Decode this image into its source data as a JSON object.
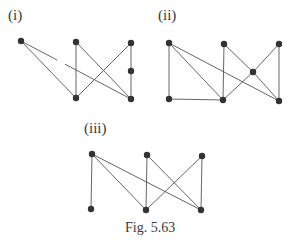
{
  "figure": {
    "caption": "Fig. 5.63",
    "colors": {
      "edge": "#555555",
      "vertex": "#333333",
      "text": "#3a3a3a"
    },
    "graphs": [
      {
        "id": "i",
        "label": "(i)",
        "label_pos": [
          8,
          8
        ],
        "vertices": [
          {
            "id": "a",
            "x": 21,
            "y": 41
          },
          {
            "id": "b",
            "x": 76,
            "y": 42
          },
          {
            "id": "c",
            "x": 131,
            "y": 43
          },
          {
            "id": "d",
            "x": 131,
            "y": 71
          },
          {
            "id": "e",
            "x": 76,
            "y": 98
          },
          {
            "id": "f",
            "x": 131,
            "y": 99
          }
        ],
        "edges": [
          {
            "from": "a",
            "to": "e"
          },
          {
            "from": "a",
            "to": "f",
            "broken": true,
            "gap": [
              0.33,
              0.4
            ]
          },
          {
            "from": "b",
            "to": "e"
          },
          {
            "from": "b",
            "to": "f"
          },
          {
            "from": "c",
            "to": "e"
          },
          {
            "from": "c",
            "to": "d"
          },
          {
            "from": "d",
            "to": "f"
          }
        ]
      },
      {
        "id": "ii",
        "label": "(ii)",
        "label_pos": [
          158,
          8
        ],
        "vertices": [
          {
            "id": "a",
            "x": 169,
            "y": 43
          },
          {
            "id": "b",
            "x": 224,
            "y": 44
          },
          {
            "id": "c",
            "x": 279,
            "y": 44
          },
          {
            "id": "m",
            "x": 253,
            "y": 72
          },
          {
            "id": "d",
            "x": 169,
            "y": 99
          },
          {
            "id": "e",
            "x": 223,
            "y": 100
          },
          {
            "id": "f",
            "x": 279,
            "y": 101
          }
        ],
        "edges": [
          {
            "from": "a",
            "to": "d"
          },
          {
            "from": "a",
            "to": "e"
          },
          {
            "from": "a",
            "to": "f"
          },
          {
            "from": "b",
            "to": "e"
          },
          {
            "from": "b",
            "to": "m"
          },
          {
            "from": "m",
            "to": "f"
          },
          {
            "from": "c",
            "to": "m"
          },
          {
            "from": "m",
            "to": "e"
          },
          {
            "from": "c",
            "to": "f"
          },
          {
            "from": "d",
            "to": "e"
          }
        ]
      },
      {
        "id": "iii",
        "label": "(iii)",
        "label_pos": [
          84,
          121
        ],
        "vertices": [
          {
            "id": "a",
            "x": 92,
            "y": 154
          },
          {
            "id": "b",
            "x": 147,
            "y": 155
          },
          {
            "id": "c",
            "x": 202,
            "y": 156
          },
          {
            "id": "d",
            "x": 91,
            "y": 209
          },
          {
            "id": "e",
            "x": 146,
            "y": 210
          },
          {
            "id": "f",
            "x": 201,
            "y": 210
          }
        ],
        "edges": [
          {
            "from": "a",
            "to": "d"
          },
          {
            "from": "a",
            "to": "e"
          },
          {
            "from": "a",
            "to": "f"
          },
          {
            "from": "b",
            "to": "e"
          },
          {
            "from": "b",
            "to": "f"
          },
          {
            "from": "c",
            "to": "e"
          },
          {
            "from": "c",
            "to": "f"
          }
        ]
      }
    ]
  }
}
